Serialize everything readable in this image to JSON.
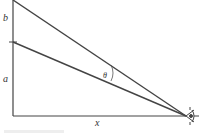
{
  "diagram": {
    "labels": {
      "b": "b",
      "a": "a",
      "x": "x",
      "theta": "θ"
    },
    "colors": {
      "line": "#444444",
      "background": "#ffffff"
    },
    "icons": {
      "observer": "eye-icon"
    }
  }
}
